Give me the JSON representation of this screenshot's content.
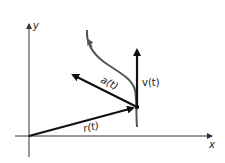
{
  "diagram": {
    "axes": {
      "x_label": "x",
      "y_label": "y"
    },
    "vectors": [
      {
        "name": "position",
        "label": "r(t)"
      },
      {
        "name": "acceleration",
        "label": "a(t)"
      },
      {
        "name": "velocity",
        "label": "v(t)"
      }
    ],
    "colors": {
      "vector": "#111111",
      "curve": "#555555",
      "axis": "#333333"
    }
  }
}
